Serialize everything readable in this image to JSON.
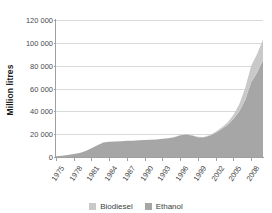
{
  "chart_data": {
    "type": "area",
    "stacked": true,
    "title": "",
    "xlabel": "",
    "ylabel": "Million litres",
    "ylim": [
      0,
      120000
    ],
    "ytick_labels": [
      "120 000",
      "100 000",
      "80 000",
      "60 000",
      "40 000",
      "20 000",
      "0"
    ],
    "ytick_values": [
      120000,
      100000,
      80000,
      60000,
      40000,
      20000,
      0
    ],
    "xlim": [
      1975,
      2010
    ],
    "xtick_labels": [
      "1975",
      "1978",
      "1981",
      "1984",
      "1987",
      "1990",
      "1993",
      "1996",
      "1999",
      "2002",
      "2005",
      "2008"
    ],
    "xtick_values": [
      1975,
      1978,
      1981,
      1984,
      1987,
      1990,
      1993,
      1996,
      1999,
      2002,
      2005,
      2008
    ],
    "grid": "horizontal",
    "legend_position": "bottom",
    "x": [
      1975,
      1976,
      1977,
      1978,
      1979,
      1980,
      1981,
      1982,
      1983,
      1984,
      1985,
      1986,
      1987,
      1988,
      1989,
      1990,
      1991,
      1992,
      1993,
      1994,
      1995,
      1996,
      1997,
      1998,
      1999,
      2000,
      2001,
      2002,
      2003,
      2004,
      2005,
      2006,
      2007,
      2008,
      2009,
      2010
    ],
    "series": [
      {
        "name": "Ethanol",
        "color": "#a6a6a6",
        "values": [
          600,
          1100,
          1800,
          2600,
          3600,
          5200,
          7600,
          10200,
          12600,
          13400,
          13600,
          13900,
          14200,
          14300,
          14600,
          14900,
          15100,
          15400,
          15900,
          16400,
          17400,
          19000,
          19600,
          18900,
          17400,
          17200,
          18700,
          21300,
          24600,
          28100,
          33200,
          40100,
          50200,
          65400,
          73900,
          84800
        ]
      },
      {
        "name": "Biodiesel",
        "color": "#c9c9c9",
        "values": [
          0,
          0,
          0,
          0,
          0,
          0,
          0,
          0,
          0,
          0,
          0,
          0,
          0,
          0,
          0,
          0,
          0,
          0,
          0,
          0,
          100,
          150,
          200,
          250,
          300,
          400,
          600,
          900,
          1300,
          2100,
          3600,
          6300,
          10400,
          14500,
          16300,
          18200
        ]
      }
    ],
    "legend": [
      {
        "name": "Biodiesel",
        "color": "#c9c9c9"
      },
      {
        "name": "Ethanol",
        "color": "#a6a6a6"
      }
    ]
  }
}
